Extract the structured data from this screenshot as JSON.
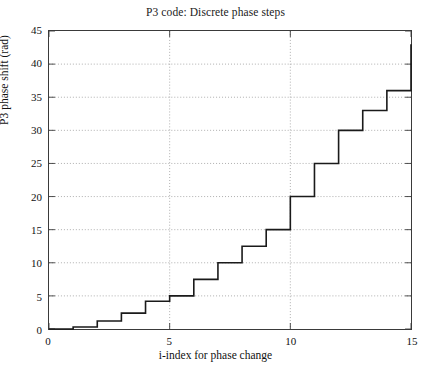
{
  "chart_data": {
    "type": "line",
    "line_style": "step-post",
    "title": "P3 code: Discrete phase steps",
    "xlabel": "i-index for phase change",
    "ylabel": "P3 phase shift (rad)",
    "xlim": [
      0,
      15
    ],
    "ylim": [
      0,
      45
    ],
    "xticks": [
      0,
      5,
      10,
      15
    ],
    "yticks": [
      0,
      5,
      10,
      15,
      20,
      25,
      30,
      35,
      40,
      45
    ],
    "xtick_labels": [
      "0",
      "5",
      "10",
      "15"
    ],
    "ytick_labels": [
      "0",
      "5",
      "10",
      "15",
      "20",
      "25",
      "30",
      "35",
      "40",
      "45"
    ],
    "grid": true,
    "grid_style": "dotted",
    "legend": null,
    "series": [
      {
        "name": "P3 phase shift",
        "color": "#1a1a1a",
        "linewidth": 1.6,
        "x": [
          0,
          1,
          2,
          3,
          4,
          5,
          6,
          7,
          8,
          9,
          10,
          11,
          12,
          13,
          14,
          15
        ],
        "values": [
          0,
          0.3,
          1.2,
          2.4,
          4.2,
          5.0,
          7.5,
          10.0,
          12.5,
          15.0,
          20.0,
          25.0,
          30.0,
          33.0,
          36.0,
          39.0
        ],
        "final_value": 43.0
      }
    ]
  },
  "figure": {
    "title_text": "P3 code: Discrete phase steps",
    "xaxis_title": "i-index for phase change",
    "yaxis_title": "P3 phase shift (rad)"
  }
}
